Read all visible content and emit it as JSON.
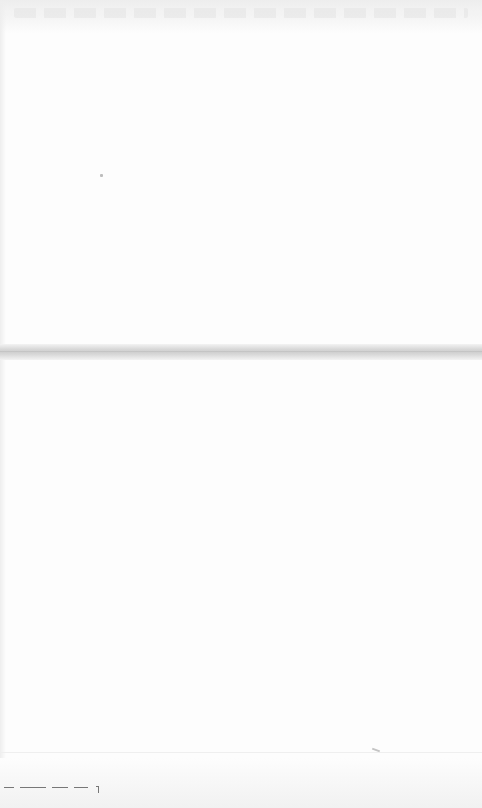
{
  "window": {
    "background": "#fdfdfd",
    "header": {
      "text": ""
    },
    "divider_color": "#cfcfcf",
    "footer": {
      "text": ""
    }
  }
}
